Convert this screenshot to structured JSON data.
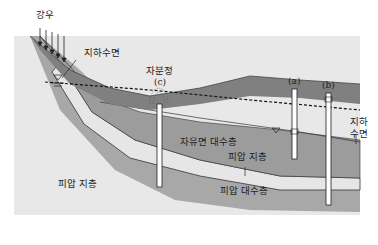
{
  "diagram": {
    "title": "",
    "labels": {
      "rainfall": "강우",
      "water_table_top": "지하수면",
      "flowing_well": "자분정",
      "well_c": "(c)",
      "well_a": "(a)",
      "well_b": "(b)",
      "water_table_right_1": "지하",
      "water_table_right_2": "수면",
      "unconfined_aquifer": "자유면 대수층",
      "confining_layer_upper": "피압 지층",
      "confined_aquifer": "피압 대수층",
      "confining_layer_lower": "피압 지층"
    },
    "colors": {
      "background": "#ffffff",
      "bedrock": "#e4e4e4",
      "confined_aquifer": "#a9a9a9",
      "confining_band": "#e6e6e6",
      "unconfined_aquifer": "#9c9c9c",
      "topsoil": "#7d7d7d",
      "outline": "#333333"
    }
  }
}
